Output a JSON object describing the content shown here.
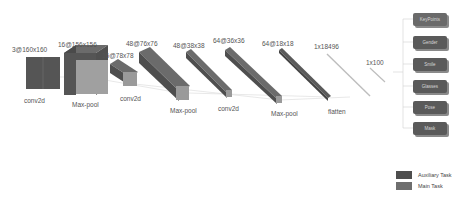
{
  "diagram": {
    "layers": [
      {
        "shape": "3@160x160",
        "op": "conv2d"
      },
      {
        "shape": "16@156x156",
        "op": "Max-pool"
      },
      {
        "shape": "16@78x78",
        "op": "conv2d"
      },
      {
        "shape": "48@76x76",
        "op": "Max-pool"
      },
      {
        "shape": "48@38x38",
        "op": "conv2d"
      },
      {
        "shape": "64@36x36",
        "op": "Max-pool"
      },
      {
        "shape": "64@18x18",
        "op": "flatten"
      },
      {
        "shape": "1x18496",
        "op": ""
      },
      {
        "shape": "1x100",
        "op": ""
      }
    ],
    "tasks": [
      {
        "label": "KeyPoints",
        "type": "main"
      },
      {
        "label": "Gender",
        "type": "auxiliary"
      },
      {
        "label": "Smile",
        "type": "auxiliary"
      },
      {
        "label": "Glasses",
        "type": "auxiliary"
      },
      {
        "label": "Pose",
        "type": "auxiliary"
      },
      {
        "label": "Mask",
        "type": "auxiliary"
      }
    ],
    "legend": [
      {
        "label": "Auxiliary Task",
        "color": "#4e4e4e"
      },
      {
        "label": "Main Task",
        "color": "#6e6e6e"
      }
    ],
    "colors": {
      "block_front": "#9a9a9a",
      "block_side": "#555555",
      "block_top": "#6b6b6b",
      "connector": "#cccccc"
    }
  }
}
